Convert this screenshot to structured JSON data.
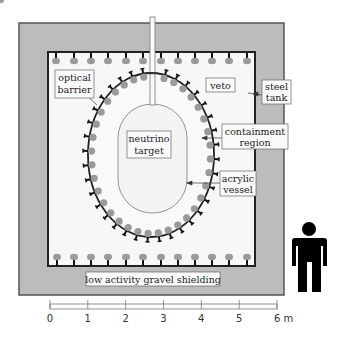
{
  "diagram": {
    "labels": {
      "optical_barrier": [
        "optical",
        "barrier"
      ],
      "veto": "veto",
      "steel_tank": [
        "steel",
        "tank"
      ],
      "neutrino_target": [
        "neutrino",
        "target"
      ],
      "containment_region": [
        "containment",
        "region"
      ],
      "acrylic_vessel": [
        "acrylic",
        "vessel"
      ],
      "gravel_shielding": "low activity gravel shielding"
    },
    "scale_bar": {
      "ticks": [
        "0",
        "1",
        "2",
        "3",
        "4",
        "5",
        "6 m"
      ],
      "unit": "m"
    },
    "colors": {
      "shielding": "#b9b9b9",
      "tank_border": "#444444",
      "pmt": "#9a9a9a",
      "pmt_stem": "#111111",
      "figure": "#000000"
    }
  }
}
